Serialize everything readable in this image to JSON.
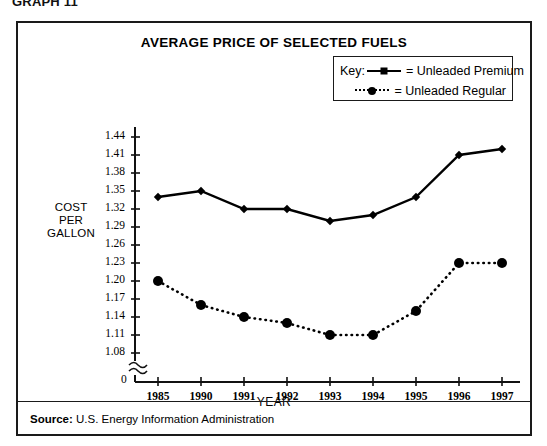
{
  "caption": "GRAPH 11",
  "chart_data": {
    "type": "line",
    "title": "AVERAGE PRICE OF SELECTED FUELS",
    "xlabel": "YEAR",
    "ylabel": "COST PER GALLON",
    "ylabel_lines": [
      "COST",
      "PER",
      "GALLON"
    ],
    "categories": [
      "1985",
      "1990",
      "1991",
      "1992",
      "1993",
      "1994",
      "1995",
      "1996",
      "1997"
    ],
    "ytick_labels": [
      "1.44",
      "1.41",
      "1.38",
      "1.35",
      "1.32",
      "1.29",
      "1.26",
      "1.23",
      "1.20",
      "1.17",
      "1.14",
      "1.11",
      "1.08"
    ],
    "yticks": [
      1.44,
      1.41,
      1.38,
      1.35,
      1.32,
      1.29,
      1.26,
      1.23,
      1.2,
      1.17,
      1.14,
      1.11,
      1.08
    ],
    "ylim": [
      1.08,
      1.44
    ],
    "origin_label": "0",
    "axis_break": true,
    "grid": false,
    "legend_position": "top-right",
    "legend_title": "Key:",
    "series": [
      {
        "name": "Unleaded Premium",
        "marker": "diamond",
        "linestyle": "solid",
        "color": "#000000",
        "values": [
          1.34,
          1.35,
          1.32,
          1.32,
          1.3,
          1.31,
          1.34,
          1.41,
          1.42
        ]
      },
      {
        "name": "Unleaded Regular",
        "marker": "circle",
        "linestyle": "dotted",
        "color": "#000000",
        "values": [
          1.2,
          1.16,
          1.14,
          1.13,
          1.11,
          1.11,
          1.15,
          1.23,
          1.23
        ]
      }
    ]
  },
  "legend": {
    "key_label": "Key:",
    "entries": [
      {
        "equals": "=",
        "label": "Unleaded Premium"
      },
      {
        "equals": "=",
        "label": "Unleaded Regular"
      }
    ]
  },
  "source": {
    "prefix": "Source:",
    "text": "U.S. Energy Information Administration"
  }
}
